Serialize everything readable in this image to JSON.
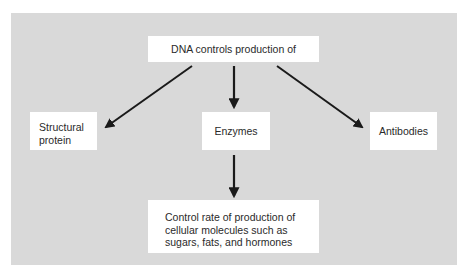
{
  "diagram": {
    "type": "flowchart",
    "colors": {
      "panel_background": "#d9d9d9",
      "box_background": "#ffffff",
      "arrow": "#1a1a1a",
      "text": "#2a2a2a"
    },
    "nodes": {
      "root": {
        "label": "DNA controls production of"
      },
      "structural_protein": {
        "lines": [
          "Structural",
          "protein"
        ]
      },
      "enzymes": {
        "label": "Enzymes"
      },
      "antibodies": {
        "label": "Antibodies"
      },
      "control_rate": {
        "lines": [
          "Control rate of production of",
          "cellular molecules such as",
          "sugars, fats, and hormones"
        ]
      }
    },
    "edges": [
      {
        "from": "root",
        "to": "structural_protein"
      },
      {
        "from": "root",
        "to": "enzymes"
      },
      {
        "from": "root",
        "to": "antibodies"
      },
      {
        "from": "enzymes",
        "to": "control_rate"
      }
    ]
  }
}
